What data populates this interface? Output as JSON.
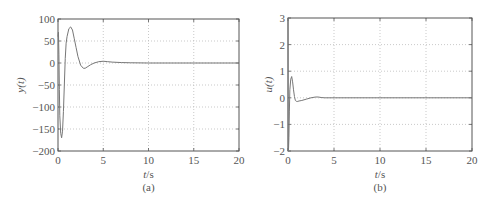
{
  "chart_data": [
    {
      "type": "line",
      "panel_caption": "(a)",
      "title": "",
      "xlabel": "t/s",
      "ylabel": "y(t)",
      "xlim": [
        0,
        20
      ],
      "ylim": [
        -200,
        100
      ],
      "xticks": [
        0,
        5,
        10,
        15,
        20
      ],
      "yticks": [
        100,
        50,
        0,
        -50,
        -100,
        -150,
        -200
      ],
      "grid": true,
      "series": [
        {
          "name": "y(t)",
          "x": [
            0,
            0.05,
            0.1,
            0.15,
            0.2,
            0.3,
            0.4,
            0.5,
            0.6,
            0.7,
            0.8,
            0.9,
            1.0,
            1.2,
            1.4,
            1.6,
            1.8,
            2.0,
            2.2,
            2.5,
            2.8,
            3.0,
            3.3,
            3.6,
            4.0,
            4.5,
            5.0,
            5.5,
            6.0,
            7.0,
            8.0,
            10.0,
            15.0,
            20.0
          ],
          "y": [
            60,
            70,
            20,
            -60,
            -120,
            -160,
            -170,
            -155,
            -110,
            -50,
            10,
            45,
            60,
            78,
            82,
            75,
            55,
            35,
            15,
            -5,
            -12,
            -12,
            -8,
            -4,
            0,
            3,
            4,
            3,
            2,
            1,
            0.5,
            0,
            0,
            0
          ]
        }
      ]
    },
    {
      "type": "line",
      "panel_caption": "(b)",
      "title": "",
      "xlabel": "t/s",
      "ylabel": "u(t)",
      "xlim": [
        0,
        20
      ],
      "ylim": [
        -2,
        3
      ],
      "xticks": [
        0,
        5,
        10,
        15,
        20
      ],
      "yticks": [
        3,
        2,
        1,
        0,
        -1,
        -2
      ],
      "grid": true,
      "series": [
        {
          "name": "u(t)",
          "x": [
            0,
            0.02,
            0.05,
            0.1,
            0.15,
            0.2,
            0.3,
            0.4,
            0.5,
            0.6,
            0.7,
            0.8,
            0.9,
            1.0,
            1.2,
            1.5,
            2.0,
            2.5,
            3.0,
            3.3,
            3.6,
            4.0,
            5.0,
            10.0,
            20.0
          ],
          "y": [
            3,
            -2,
            -2,
            -1.5,
            -0.5,
            0.3,
            0.7,
            0.8,
            0.6,
            0.3,
            0.05,
            -0.1,
            -0.13,
            -0.14,
            -0.12,
            -0.1,
            -0.05,
            0,
            0.03,
            0.03,
            0.01,
            0,
            0,
            0,
            0
          ]
        }
      ]
    }
  ],
  "panels": [
    {
      "caption": "(a)",
      "xlabel_italic": "t",
      "xlabel_unit": "/s",
      "ylabel": "y(t)",
      "xtick_labels": [
        "0",
        "5",
        "10",
        "15",
        "20"
      ],
      "ytick_labels": [
        "100",
        "50",
        "0",
        "−50",
        "−100",
        "−150",
        "−200"
      ]
    },
    {
      "caption": "(b)",
      "xlabel_italic": "t",
      "xlabel_unit": "/s",
      "ylabel": "u(t)",
      "xtick_labels": [
        "0",
        "5",
        "10",
        "15",
        "20"
      ],
      "ytick_labels": [
        "3",
        "2",
        "1",
        "0",
        "−1",
        "−2"
      ]
    }
  ],
  "colors": {
    "axis": "#555555",
    "grid": "#bbbbbb",
    "line": "#777777"
  }
}
